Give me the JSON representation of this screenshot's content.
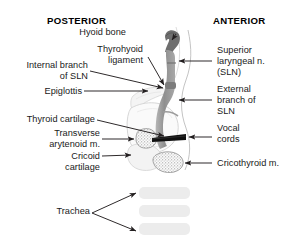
{
  "figure": {
    "background": "#ffffff",
    "width": 293,
    "height": 242
  },
  "orientation": {
    "posterior": "POSTERIOR",
    "anterior": "ANTERIOR"
  },
  "labels": {
    "hyoid_bone": "Hyoid bone",
    "thyrohyoid_ligament_l1": "Thyrohyoid",
    "thyrohyoid_ligament_l2": "ligament",
    "internal_branch_l1": "Internal branch",
    "internal_branch_l2": "of SLN",
    "epiglottis": "Epiglottis",
    "thyroid_cartilage": "Thyroid cartilage",
    "transverse_arytenoid_l1": "Transverse",
    "transverse_arytenoid_l2": "arytenoid m.",
    "cricoid_cartilage_l1": "Cricoid",
    "cricoid_cartilage_l2": "cartilage",
    "trachea": "Trachea",
    "superior_laryngeal_l1": "Superior",
    "superior_laryngeal_l2": "laryngeal n.",
    "superior_laryngeal_l3": "(SLN)",
    "external_branch_l1": "External",
    "external_branch_l2": "branch of",
    "external_branch_l3": "SLN",
    "vocal_cords_l1": "Vocal",
    "vocal_cords_l2": "cords",
    "cricothyroid_muscle": "Cricothyroid m."
  },
  "colors": {
    "text": "#1a1a1a",
    "heading": "#000000",
    "leader_line": "#231f20",
    "hyoid_bone": "#6e6e6e",
    "nerve": "#9b9b9b",
    "nerve_dark": "#7c7c7c",
    "vocal_cords": "#101010",
    "cartilage_fill": "#f2f2f2",
    "cartilage_stroke": "#c9c9c9",
    "trachea_ring": "#ececec",
    "muscle_stipple": "#8a8a8a",
    "outline": "#b5b5b5"
  }
}
